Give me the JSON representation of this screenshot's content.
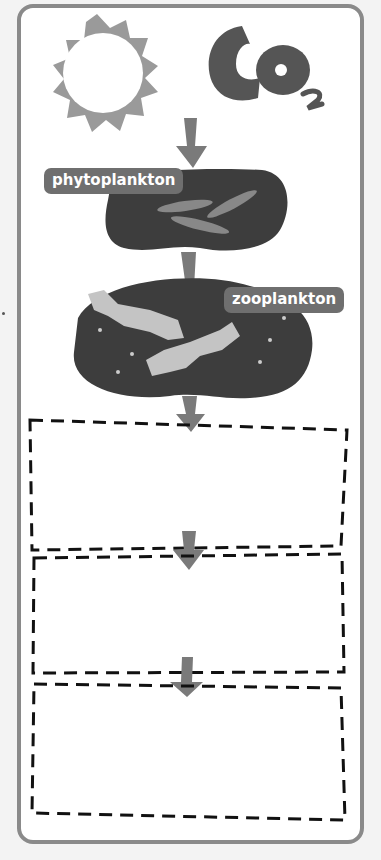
{
  "sources": [
    {
      "id": "sun",
      "name": "sun-icon"
    },
    {
      "id": "co2",
      "name": "co2-icon",
      "text": "CO",
      "subscript": "2"
    }
  ],
  "nodes": [
    {
      "id": "phytoplankton",
      "label": "phytoplankton"
    },
    {
      "id": "zooplankton",
      "label": "zooplankton"
    }
  ],
  "blank_boxes": 3,
  "colors": {
    "frame": "#8a8a8a",
    "arrow": "#7a7a7a",
    "blob": "#3d3d3d",
    "label_bg": "#6f6f6f",
    "sun": "#9a9a9a"
  }
}
